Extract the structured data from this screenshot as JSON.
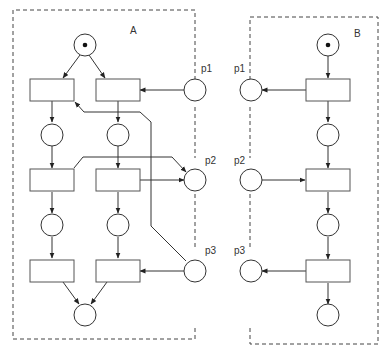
{
  "diagram": {
    "type": "petri-net",
    "components": [
      {
        "id": "A",
        "label": "A",
        "places": [
          {
            "id": "A_start",
            "tokens": 1
          },
          {
            "id": "A_l1",
            "tokens": 0
          },
          {
            "id": "A_r1",
            "tokens": 0
          },
          {
            "id": "A_l2",
            "tokens": 0
          },
          {
            "id": "A_r2",
            "tokens": 0
          },
          {
            "id": "A_end",
            "tokens": 0
          }
        ],
        "transitions": [
          "A_tl1",
          "A_tr1",
          "A_tl2",
          "A_tr2",
          "A_tl3",
          "A_tr3"
        ],
        "interface_places": [
          {
            "id": "A_p1",
            "label": "p1",
            "tokens": 0
          },
          {
            "id": "A_p2",
            "label": "p2",
            "tokens": 0
          },
          {
            "id": "A_p3",
            "label": "p3",
            "tokens": 0
          }
        ]
      },
      {
        "id": "B",
        "label": "B",
        "places": [
          {
            "id": "B_start",
            "tokens": 1
          },
          {
            "id": "B_m1",
            "tokens": 0
          },
          {
            "id": "B_m2",
            "tokens": 0
          },
          {
            "id": "B_end",
            "tokens": 0
          }
        ],
        "transitions": [
          "B_t1",
          "B_t2",
          "B_t3"
        ],
        "interface_places": [
          {
            "id": "B_p1",
            "label": "p1",
            "tokens": 0
          },
          {
            "id": "B_p2",
            "label": "p2",
            "tokens": 0
          },
          {
            "id": "B_p3",
            "label": "p3",
            "tokens": 0
          }
        ]
      }
    ],
    "arcs": [
      [
        "A_start",
        "A_tl1"
      ],
      [
        "A_start",
        "A_tr1"
      ],
      [
        "A_p1",
        "A_tr1"
      ],
      [
        "A_tl1",
        "A_l1"
      ],
      [
        "A_tr1",
        "A_r1"
      ],
      [
        "A_l1",
        "A_tl2"
      ],
      [
        "A_r1",
        "A_tr2"
      ],
      [
        "A_tl2",
        "A_p2"
      ],
      [
        "A_tr2",
        "A_p2"
      ],
      [
        "A_p3",
        "A_tl1"
      ],
      [
        "A_tl2",
        "A_l2"
      ],
      [
        "A_tr2",
        "A_r2"
      ],
      [
        "A_l2",
        "A_tl3"
      ],
      [
        "A_r2",
        "A_tr3"
      ],
      [
        "A_p3",
        "A_tr3"
      ],
      [
        "A_tl3",
        "A_end"
      ],
      [
        "A_tr3",
        "A_end"
      ],
      [
        "B_start",
        "B_t1"
      ],
      [
        "B_t1",
        "B_p1"
      ],
      [
        "B_t1",
        "B_m1"
      ],
      [
        "B_m1",
        "B_t2"
      ],
      [
        "B_p2",
        "B_t2"
      ],
      [
        "B_t2",
        "B_m2"
      ],
      [
        "B_m2",
        "B_t3"
      ],
      [
        "B_t3",
        "B_p3"
      ],
      [
        "B_t3",
        "B_end"
      ]
    ]
  }
}
